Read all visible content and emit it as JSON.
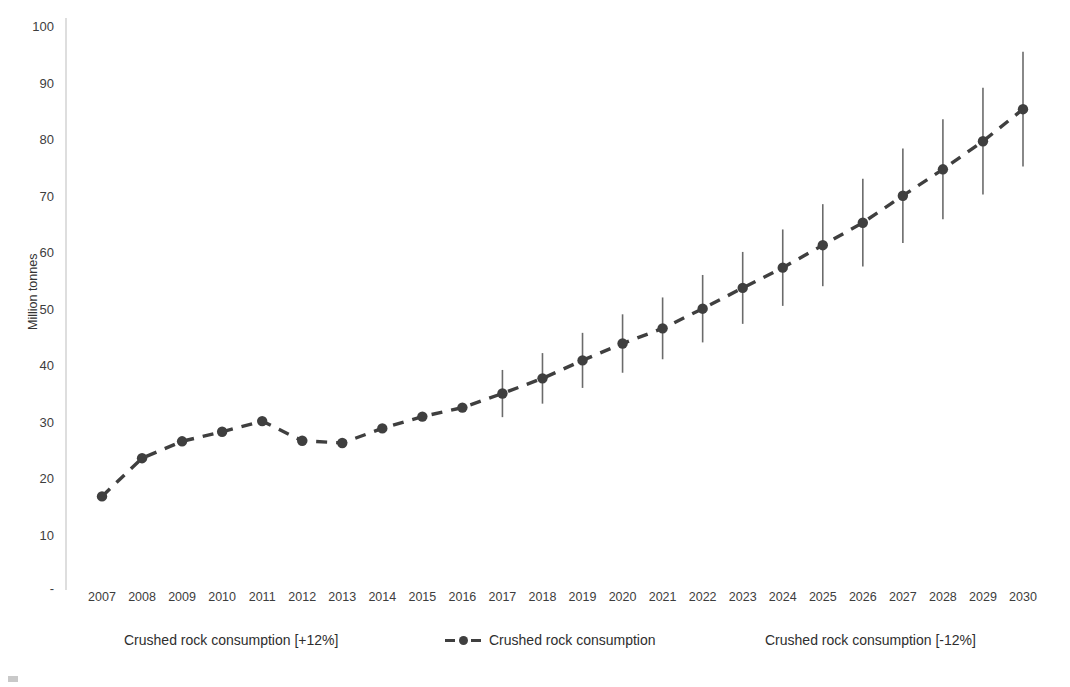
{
  "chart_data": {
    "type": "line",
    "title": "",
    "subtitle": "",
    "xlabel": "",
    "ylabel": "Million tonnes",
    "grid": false,
    "legend_position": "bottom",
    "xlim": [
      2007,
      2030
    ],
    "ylim": [
      0,
      100
    ],
    "y_ticks": [
      "100",
      "90",
      "80",
      "70",
      "60",
      "50",
      "40",
      "30",
      "20",
      "10",
      "-"
    ],
    "y_tick_values": [
      100,
      90,
      80,
      70,
      60,
      50,
      40,
      30,
      20,
      10,
      0
    ],
    "categories": [
      "2007",
      "2008",
      "2009",
      "2010",
      "2011",
      "2012",
      "2013",
      "2014",
      "2015",
      "2016",
      "2017",
      "2018",
      "2019",
      "2020",
      "2021",
      "2022",
      "2023",
      "2024",
      "2025",
      "2026",
      "2027",
      "2028",
      "2029",
      "2030"
    ],
    "series": [
      {
        "name": "Crushed rock consumption",
        "values": [
          16.3,
          23.1,
          26.1,
          27.8,
          29.7,
          26.2,
          25.8,
          28.4,
          30.5,
          32.1,
          34.6,
          37.3,
          40.5,
          43.5,
          46.2,
          49.7,
          53.4,
          57.0,
          61.0,
          65.0,
          69.8,
          74.5,
          79.5,
          85.2
        ],
        "style": "dashed-with-markers",
        "color": "#3f3f3f"
      },
      {
        "name": "Crushed rock consumption [+12%]",
        "values": [
          null,
          null,
          null,
          null,
          null,
          null,
          null,
          null,
          null,
          null,
          38.8,
          41.8,
          45.4,
          48.7,
          51.7,
          55.7,
          59.8,
          63.8,
          68.3,
          72.8,
          78.2,
          83.4,
          89.0,
          95.4
        ],
        "style": "error-bar-upper",
        "color": "#6b6b6b"
      },
      {
        "name": "Crushed rock consumption [-12%]",
        "values": [
          null,
          null,
          null,
          null,
          null,
          null,
          null,
          null,
          null,
          null,
          30.4,
          32.8,
          35.6,
          38.3,
          40.7,
          43.7,
          47.0,
          50.2,
          53.7,
          57.2,
          61.4,
          65.6,
          70.0,
          75.0
        ],
        "style": "error-bar-lower",
        "color": "#6b6b6b"
      }
    ],
    "forecast_start_year": "2017",
    "annotations": []
  },
  "legend": {
    "items": [
      {
        "label": "Crushed rock consumption [+12%]",
        "marker": "none"
      },
      {
        "label": "Crushed rock consumption",
        "marker": "dash-dot-dash"
      },
      {
        "label": "Crushed rock consumption [-12%]",
        "marker": "none"
      }
    ]
  },
  "axes": {
    "y_title": "Million tonnes"
  }
}
